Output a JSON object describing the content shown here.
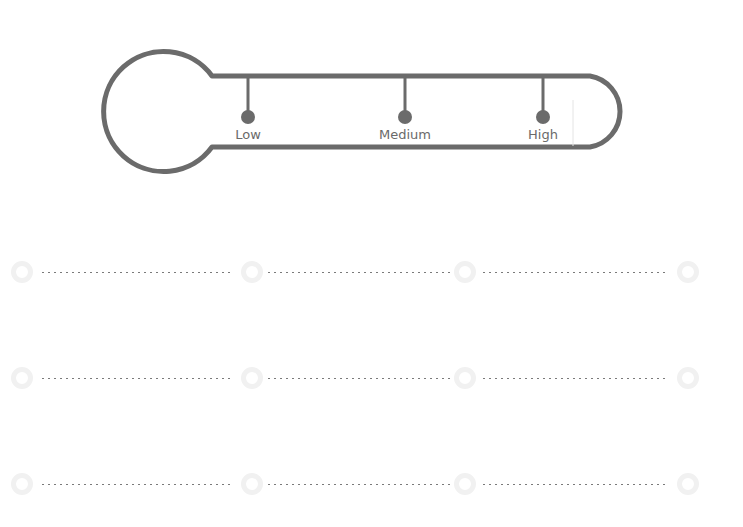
{
  "thermometer": {
    "stroke_color": "#6b6b6b",
    "levels": [
      {
        "label": "Low",
        "x": 248
      },
      {
        "label": "Medium",
        "x": 405
      },
      {
        "label": "High",
        "x": 543
      }
    ]
  },
  "answer_rows": [
    {
      "y": 257,
      "segments": 3
    },
    {
      "y": 363,
      "segments": 3
    },
    {
      "y": 469,
      "segments": 3
    }
  ],
  "colors": {
    "dots": "#7a7a7a",
    "rings": "#f1f1f1"
  }
}
